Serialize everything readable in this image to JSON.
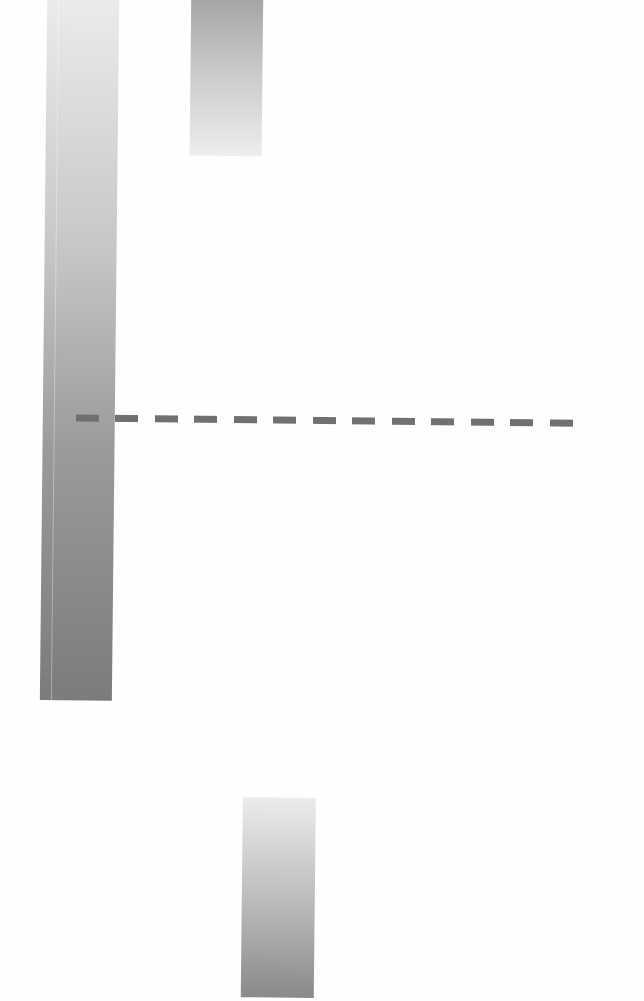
{
  "chart_data": {
    "type": "bar",
    "orientation": "vertical (rotated waterfall-style)",
    "title": "",
    "xlabel": "",
    "ylabel": "",
    "categories": [
      "bar-1",
      "bar-2",
      "bar-3"
    ],
    "bars": [
      {
        "name": "bar-1",
        "x_px": [
          42,
          114
        ],
        "y_px": [
          0,
          703
        ],
        "gradient": [
          "#ececec",
          "#7b7b7b"
        ]
      },
      {
        "name": "bar-2",
        "x_px": [
          186,
          258
        ],
        "y_px": [
          0,
          157
        ],
        "gradient": [
          "#a3a3a3",
          "#ededed"
        ]
      },
      {
        "name": "bar-3",
        "x_px": [
          246,
          319
        ],
        "y_px": [
          798,
          995
        ],
        "gradient": [
          "#ececec",
          "#8a8a8a"
        ]
      }
    ],
    "values": [
      703,
      157,
      197
    ],
    "reference_line": {
      "style": "dashed",
      "y_px": 422,
      "x_px": [
        75,
        574
      ],
      "color": "#707070"
    },
    "grid": false,
    "legend": null
  },
  "colors": {
    "background": "#fefefe",
    "bar_dark": "#7b7b7b",
    "bar_light": "#ececec",
    "reference_line": "#707070"
  }
}
